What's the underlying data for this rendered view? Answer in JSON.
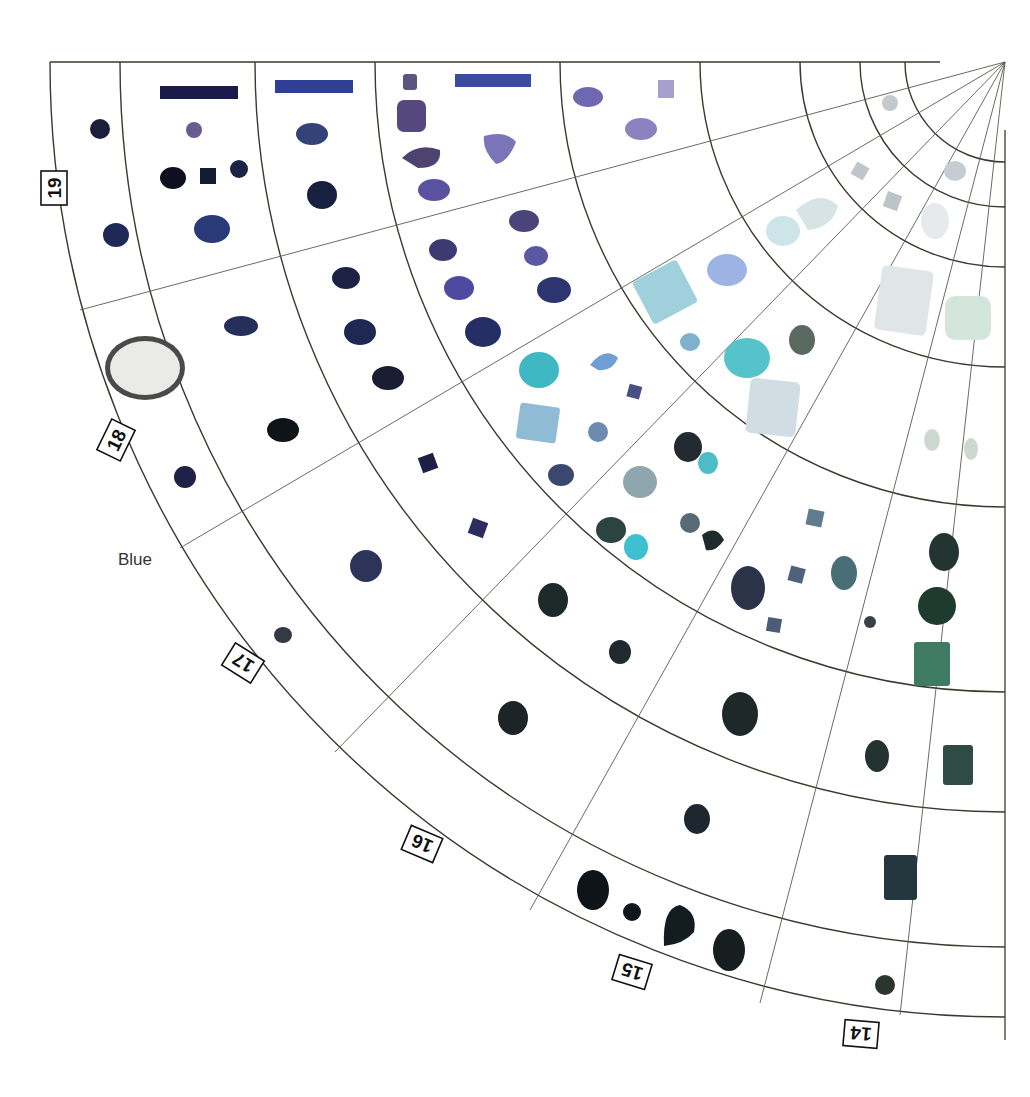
{
  "diagram": {
    "title": "",
    "sector_label": "Blue",
    "ring_labels": [
      "19",
      "18",
      "17",
      "16",
      "15",
      "14"
    ],
    "colors": {
      "grid_line": "#3a3a2e",
      "background": "#ffffff",
      "dark_blue": "#1b2140",
      "violet": "#6b62a8",
      "light_violet": "#a9a3d6",
      "aqua": "#9fd4de",
      "turquoise": "#3fb6c0",
      "teal_dark": "#1f3a3e",
      "green": "#3f7a63",
      "pale": "#e6eef0"
    },
    "swatches": [
      {
        "label": "dark-navy-bar",
        "color": "#1a1b4a"
      },
      {
        "label": "blue-bar",
        "color": "#2f3f94"
      },
      {
        "label": "indigo-bar",
        "color": "#3a4ba0"
      }
    ]
  }
}
